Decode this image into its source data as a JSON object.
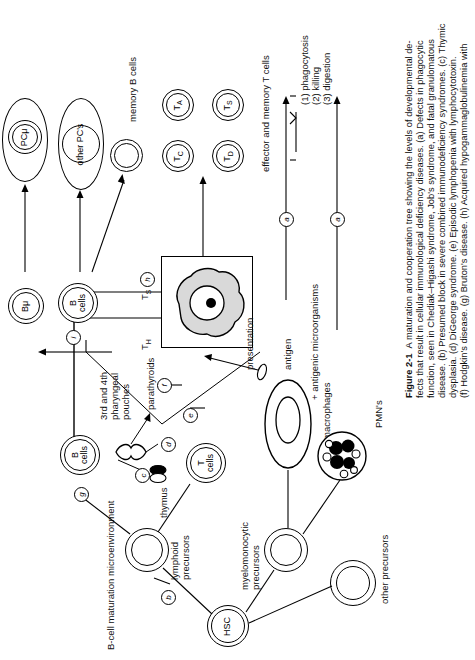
{
  "figure": {
    "number": "Figure 2-1",
    "caption_lines": [
      "A maturation and cooperation tree showing the levels of developmental de-",
      "fects that result in cellular immunological deficiency diseases. (a) Defects in phagocytic",
      "function, seen in Chediak–Higashi syndrome, Job's syndrome, and fatal granulomatous",
      "disease. (b) Presumed block in severe combined immunodeficiency syndromes. (c) Thymic",
      "dysplasia. (d) DiGeorge syndrome. (e) Episodic lymphopenia with lymphocytotoxin.",
      "(f) Hodgkin's disease. (g) Bruton's disease. (h) Acquired hypogammaglobulinemia with"
    ],
    "caption_full": "Figure 2-1  A maturation and cooperation tree showing the levels of developmental defects that result in cellular immunological deficiency diseases. (a) Defects in phagocytic function, seen in Chediak–Higashi syndrome, Job's syndrome, and fatal granulomatous disease. (b) Presumed block in severe combined immunodeficiency syndromes. (c) Thymic dysplasia. (d) DiGeorge syndrome. (e) Episodic lymphopenia with lymphocytotoxin. (f) Hodgkin's disease. (g) Bruton's disease. (h) Acquired hypogammaglobulinemia with"
  },
  "cells": {
    "pc_mu": "PCμ",
    "other_pcs": "other PC's",
    "b_mu": "Bμ",
    "b_cells": "B\ncells",
    "b_cells_l1": "B",
    "b_cells_l2": "cells",
    "t_cells_l1": "T",
    "t_cells_l2": "cells",
    "t_a": "T",
    "t_a_sub": "A",
    "t_s": "T",
    "t_s_sub": "S",
    "t_c": "T",
    "t_c_sub": "C",
    "t_d": "T",
    "t_d_sub": "D",
    "hsc": "HSC"
  },
  "labels": {
    "memory_b_cells": "memory B cells",
    "effector_memory_t": "effector and memory T cells",
    "phagocytosis": "(1) phagocytosis",
    "killing": "(2) killing",
    "digestion": "(3) digestion",
    "t_h": "T",
    "t_h_sub": "H",
    "t_s_signal": "T",
    "t_s_signal_sub": "S",
    "pharyngeal_l1": "3rd and 4th",
    "pharyngeal_l2": "pharyngeal",
    "pharyngeal_l3": "pouches",
    "parathyroids": "parathyroids",
    "thymus": "thymus",
    "antigen": "antigen",
    "presentation": "presentation",
    "antigenic_micro": "+ antigenic microorganisms",
    "macrophages": "macrophages",
    "pmns": "PMN's",
    "lymphoid_l1": "lymphoid",
    "lymphoid_l2": "precursors",
    "myelo_l1": "myelomonocytic",
    "myelo_l2": "precursors",
    "bcell_micro": "B-cell maturation microenvironment",
    "other_precursors": "other precursors"
  },
  "defect_markers": {
    "a1": "a",
    "a2": "a",
    "b": "b",
    "c": "c",
    "d": "d",
    "e": "e",
    "f": "f",
    "g": "g",
    "h": "h",
    "i": "i"
  },
  "colors": {
    "ink": "#000000",
    "paper": "#ffffff",
    "cell_fill": "#d9d9d9"
  }
}
